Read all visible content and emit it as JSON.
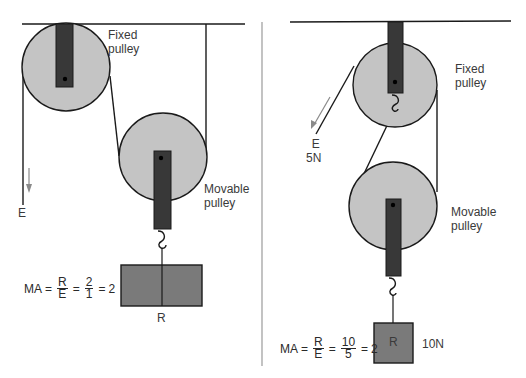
{
  "colors": {
    "pulley_fill": "#c4c4c4",
    "bracket_fill": "#383838",
    "load_fill": "#7a7a7a",
    "rope": "#1a1a1a",
    "arrow": "#8a8a8a",
    "divider": "#9a9a9a",
    "text": "#3a3a3a"
  },
  "left_panel": {
    "fixed_pulley_label_line1": "Fixed",
    "fixed_pulley_label_line2": "pulley",
    "movable_pulley_label_line1": "Movable",
    "movable_pulley_label_line2": "pulley",
    "effort_label": "E",
    "load_label": "R",
    "formula": {
      "lhs": "MA",
      "eq1": "=",
      "frac1_num": "R",
      "frac1_den": "E",
      "eq2": "=",
      "frac2_num": "2",
      "frac2_den": "1",
      "eq3": "=",
      "result": "2"
    }
  },
  "right_panel": {
    "fixed_pulley_label_line1": "Fixed",
    "fixed_pulley_label_line2": "pulley",
    "movable_pulley_label_line1": "Movable",
    "movable_pulley_label_line2": "pulley",
    "effort_label": "E",
    "effort_value": "5N",
    "load_label": "R",
    "load_value": "10N",
    "formula": {
      "lhs": "MA",
      "eq1": "=",
      "frac1_num": "R",
      "frac1_den": "E",
      "eq2": "=",
      "frac2_num": "10",
      "frac2_den": "5",
      "eq3": "=",
      "result": "2"
    }
  }
}
